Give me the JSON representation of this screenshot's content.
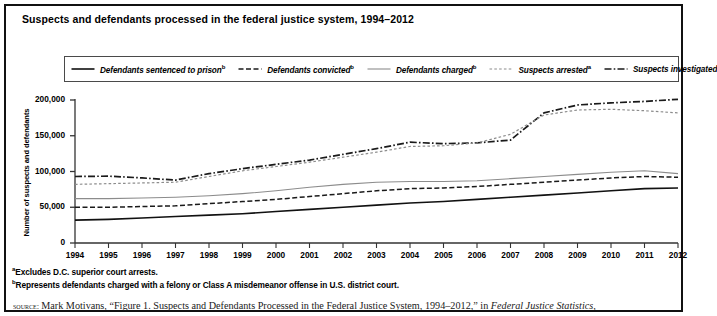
{
  "figure": {
    "title": "Suspects and defendants processed in the federal justice system, 1994–2012",
    "y_axis_title": "Number of suspects and defendants"
  },
  "legend": {
    "entries": [
      {
        "label": "Defendants sentenced to prison",
        "sup": "b",
        "style": "solid-dark",
        "name": "legend-defendants-sentenced-to-prison"
      },
      {
        "label": "Defendants convicted",
        "sup": "b",
        "style": "dashed-dark",
        "name": "legend-defendants-convicted"
      },
      {
        "label": "Defendants charged",
        "sup": "b",
        "style": "solid-gray",
        "name": "legend-defendants-charged"
      },
      {
        "label": "Suspects arrested",
        "sup": "a",
        "style": "dotted-gray",
        "name": "legend-suspects-arrested"
      },
      {
        "label": "Suspects investigated",
        "sup": "",
        "style": "dashdot-dark",
        "name": "legend-suspects-investigated"
      }
    ]
  },
  "footnotes": {
    "a_marker": "a",
    "a_text": "Excludes D.C. superior court arrests.",
    "b_marker": "b",
    "b_text": "Represents defendants charged with a felony or Class A misdemeanor offense in U.S. district court."
  },
  "source": {
    "label": "source:",
    "text_before_italic": "Mark Motivans, “Figure 1. Suspects and Defendants Processed in the Federal Justice System, 1994–2012,” in ",
    "italic_text": "Federal Justice Statistics,"
  },
  "chart_data": {
    "type": "line",
    "title": "Suspects and defendants processed in the federal justice system, 1994–2012",
    "xlabel": "",
    "ylabel": "Number of suspects and defendants",
    "xlim": [
      1994,
      2012
    ],
    "ylim": [
      0,
      200000
    ],
    "yticks": [
      0,
      50000,
      100000,
      150000,
      200000
    ],
    "ytick_labels": [
      "0",
      "50,000",
      "100,000",
      "150,000",
      "200,000"
    ],
    "grid": false,
    "legend_position": "top",
    "x": [
      1994,
      1995,
      1996,
      1997,
      1998,
      1999,
      2000,
      2001,
      2002,
      2003,
      2004,
      2005,
      2006,
      2007,
      2008,
      2009,
      2010,
      2011,
      2012
    ],
    "xtick_labels": [
      "1994",
      "1995",
      "1996",
      "1997",
      "1998",
      "1999",
      "2000",
      "2001",
      "2002",
      "2003",
      "2004",
      "2005",
      "2006",
      "2007",
      "2008",
      "2009",
      "2010",
      "2011",
      "2012"
    ],
    "series": [
      {
        "name": "Suspects investigated",
        "style": "dashdot-dark",
        "color": "#1a1a1a",
        "values": [
          93000,
          93500,
          91000,
          88000,
          97000,
          104000,
          110000,
          116000,
          124000,
          132000,
          141000,
          139000,
          140000,
          144000,
          182000,
          193000,
          196000,
          198000,
          201000
        ]
      },
      {
        "name": "Suspects arrested",
        "style": "dotted-gray",
        "color": "#8c8c8c",
        "values": [
          82000,
          83000,
          84000,
          85000,
          93000,
          101000,
          107000,
          113000,
          120000,
          127000,
          135000,
          136000,
          140000,
          152000,
          179000,
          186000,
          187000,
          185000,
          182000
        ]
      },
      {
        "name": "Defendants charged",
        "style": "solid-gray",
        "color": "#8c8c8c",
        "values": [
          62000,
          62000,
          63000,
          64000,
          66000,
          69000,
          73000,
          78000,
          82000,
          85000,
          86000,
          86000,
          87000,
          90000,
          93000,
          96000,
          99000,
          101000,
          97000
        ]
      },
      {
        "name": "Defendants convicted",
        "style": "dashed-dark",
        "color": "#1a1a1a",
        "values": [
          50000,
          50000,
          51000,
          52000,
          55000,
          58000,
          61000,
          65000,
          69000,
          73000,
          76000,
          77000,
          79000,
          82000,
          85000,
          88000,
          91000,
          93000,
          92000
        ]
      },
      {
        "name": "Defendants sentenced to prison",
        "style": "solid-dark",
        "color": "#111111",
        "values": [
          32000,
          33000,
          35000,
          37000,
          39000,
          41000,
          44000,
          47000,
          50000,
          53000,
          56000,
          58000,
          61000,
          64000,
          67000,
          70000,
          73000,
          76000,
          77000
        ]
      }
    ]
  }
}
